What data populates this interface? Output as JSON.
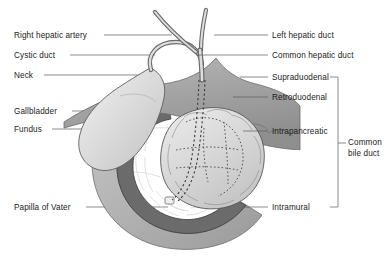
{
  "figure": {
    "type": "anatomical-diagram",
    "background": "#ffffff",
    "ink": "#1b1b1b"
  },
  "labels_left": [
    {
      "id": "right-hepatic-artery",
      "text": "Right hepatic artery",
      "x": 14,
      "y": 31,
      "leader_from": 104,
      "leader_to": 172,
      "leader_y": 35
    },
    {
      "id": "cystic-duct",
      "text": "Cystic duct",
      "x": 14,
      "y": 51,
      "leader_from": 70,
      "leader_to": 155,
      "leader_y": 55
    },
    {
      "id": "neck",
      "text": "Neck",
      "x": 14,
      "y": 71,
      "leader_from": 44,
      "leader_to": 140,
      "leader_y": 75
    },
    {
      "id": "gallbladder",
      "text": "Gallbladder",
      "x": 14,
      "y": 107,
      "leader_from": 72,
      "leader_to": 128,
      "leader_y": 111
    },
    {
      "id": "fundus",
      "text": "Fundus",
      "x": 14,
      "y": 125,
      "leader_from": 52,
      "leader_to": 112,
      "leader_y": 129
    },
    {
      "id": "papilla-of-vater",
      "text": "Papilla of  Vater",
      "x": 14,
      "y": 203,
      "leader_from": 86,
      "leader_to": 168,
      "leader_y": 207
    }
  ],
  "labels_right": [
    {
      "id": "left-hepatic-duct",
      "text": "Left hepatic duct",
      "x": 272,
      "y": 31,
      "leader_from": 214,
      "leader_to": 268,
      "leader_y": 35
    },
    {
      "id": "common-hepatic-duct",
      "text": "Common hepatic duct",
      "x": 272,
      "y": 51,
      "leader_from": 196,
      "leader_to": 268,
      "leader_y": 55
    },
    {
      "id": "supraduodenal",
      "text": "Supraduodenal",
      "x": 272,
      "y": 73,
      "leader_from": 240,
      "leader_to": 268,
      "leader_y": 77
    },
    {
      "id": "retroduodenal",
      "text": "Retroduodenal",
      "x": 272,
      "y": 93,
      "leader_from": 233,
      "leader_to": 268,
      "leader_y": 97
    },
    {
      "id": "intrapancreatic",
      "text": "Intrapancreatic",
      "x": 272,
      "y": 127,
      "leader_from": 243,
      "leader_to": 268,
      "leader_y": 131
    },
    {
      "id": "intramural",
      "text": "Intramural",
      "x": 272,
      "y": 203,
      "leader_from": 243,
      "leader_to": 268,
      "leader_y": 207
    }
  ],
  "bracket_label": {
    "id": "common-bile-duct",
    "line1": "Common",
    "line2": "bile duct",
    "x": 348,
    "y": 138,
    "bracket": {
      "x": 338,
      "top": 77,
      "bottom": 207,
      "arm_in": 330,
      "tick_out": 346,
      "tick_y": 143
    }
  },
  "organs": [
    {
      "id": "gallbladder",
      "label": "Gallbladder",
      "fill": "#d6d6d6"
    },
    {
      "id": "liver-bed",
      "label": "Liver / porta hepatis",
      "fill": "#a6a6a6"
    },
    {
      "id": "duodenum-wall",
      "label": "Duodenum",
      "fill": "#b4b4b4"
    },
    {
      "id": "duodenum-mucosa",
      "label": "Duodenal folds",
      "fill": "#6e6e6e"
    },
    {
      "id": "pancreas-head",
      "label": "Pancreas",
      "fill": "#dcdcdc"
    },
    {
      "id": "bile-duct",
      "label": "Common bile duct",
      "fill": "#c9c9c9"
    }
  ]
}
